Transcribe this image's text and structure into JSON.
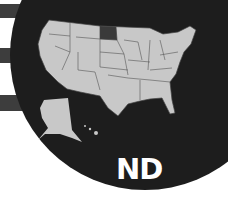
{
  "map": {
    "subject": "United States",
    "highlighted_state": "North Dakota",
    "label": "ND",
    "colors": {
      "background": "#ffffff",
      "circle": "#1d1d1d",
      "states": "#c8c8c8",
      "state_borders": "#444444",
      "highlight": "#3a3a3a",
      "stripes": "#3d3d3d",
      "label": "#ffffff"
    }
  }
}
